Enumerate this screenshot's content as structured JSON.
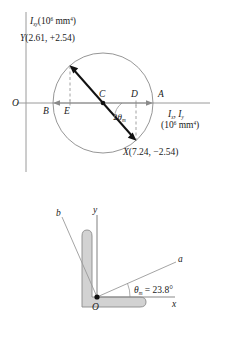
{
  "figure": {
    "title_hidden": "",
    "mohr_circle": {
      "vertical_axis_label": {
        "symbol": "I",
        "subscript": "xy",
        "units": "(10",
        "units_exp": "6",
        "units_tail": " mm",
        "units_exp2": "4",
        "units_close": ")"
      },
      "horizontal_axis_label": {
        "line1_sym1": "I",
        "line1_sub1": "x",
        "line1_sep": ", ",
        "line1_sym2": "I",
        "line1_sub2": "y",
        "line2": "(10",
        "line2_exp": "6",
        "line2_tail": " mm",
        "line2_exp2": "4",
        "line2_close": ")"
      },
      "origin_label": "O",
      "point_labels": {
        "Y": "Y",
        "Y_value": "(2.61, +2.54)",
        "X": "X",
        "X_value": "(7.24, −2.54)",
        "A": "A",
        "B": "B",
        "C": "C",
        "D": "D",
        "E": "E"
      },
      "angle_label": {
        "prefix": "2",
        "theta": "θ",
        "sub": "m"
      },
      "colors": {
        "axis": "#9a9a9a",
        "circle": "#8a8a8a",
        "diameter": "#111111",
        "dashed": "#8a8a8a",
        "arrow": "#8a8a8a"
      }
    },
    "section_diagram": {
      "axis_labels": {
        "y": "y",
        "x": "x",
        "a": "a",
        "b": "b",
        "origin": "O"
      },
      "angle_text": {
        "theta": "θ",
        "sub": "m",
        "equals": " = 23.8°"
      },
      "colors": {
        "shape_fill": "#d2d2d2",
        "shape_stroke": "#8a8a8a",
        "axis": "#8a8a8a",
        "principal_axis": "#9a9a9a",
        "origin_dot": "#111111"
      }
    }
  }
}
